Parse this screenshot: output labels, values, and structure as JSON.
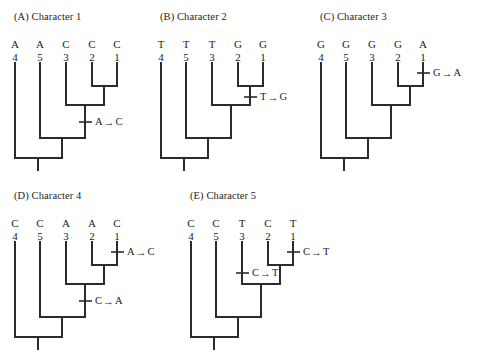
{
  "figure": {
    "background": "#ffffff",
    "line_color": "#2b2b2b",
    "panels": [
      {
        "id": "A",
        "title": "(A)  Character 1",
        "tips": [
          {
            "state": "A",
            "num": "4"
          },
          {
            "state": "A",
            "num": "5"
          },
          {
            "state": "C",
            "num": "3"
          },
          {
            "state": "C",
            "num": "2"
          },
          {
            "state": "C",
            "num": "1"
          }
        ],
        "changes": [
          {
            "from": "A",
            "arrow": "→",
            "to": "C",
            "branch": "internal-node-3-clade"
          }
        ]
      },
      {
        "id": "B",
        "title": "(B)  Character 2",
        "tips": [
          {
            "state": "T",
            "num": "4"
          },
          {
            "state": "T",
            "num": "5"
          },
          {
            "state": "T",
            "num": "3"
          },
          {
            "state": "G",
            "num": "2"
          },
          {
            "state": "G",
            "num": "1"
          }
        ],
        "changes": [
          {
            "from": "T",
            "arrow": "→",
            "to": "G",
            "branch": "internal-node-1-2-clade"
          }
        ]
      },
      {
        "id": "C",
        "title": "(C)  Character 3",
        "tips": [
          {
            "state": "G",
            "num": "4"
          },
          {
            "state": "G",
            "num": "5"
          },
          {
            "state": "G",
            "num": "3"
          },
          {
            "state": "G",
            "num": "2"
          },
          {
            "state": "A",
            "num": "1"
          }
        ],
        "changes": [
          {
            "from": "G",
            "arrow": "→",
            "to": "A",
            "branch": "terminal-branch-taxon-1"
          }
        ]
      },
      {
        "id": "D",
        "title": "(D)  Character 4",
        "tips": [
          {
            "state": "C",
            "num": "4"
          },
          {
            "state": "C",
            "num": "5"
          },
          {
            "state": "A",
            "num": "3"
          },
          {
            "state": "A",
            "num": "2"
          },
          {
            "state": "C",
            "num": "1"
          }
        ],
        "changes": [
          {
            "from": "A",
            "arrow": "→",
            "to": "C",
            "branch": "terminal-branch-taxon-1"
          },
          {
            "from": "C",
            "arrow": "→",
            "to": "A",
            "branch": "internal-node-3-clade"
          }
        ]
      },
      {
        "id": "E",
        "title": "(E)  Character 5",
        "tips": [
          {
            "state": "C",
            "num": "4"
          },
          {
            "state": "C",
            "num": "5"
          },
          {
            "state": "T",
            "num": "3"
          },
          {
            "state": "C",
            "num": "2"
          },
          {
            "state": "T",
            "num": "1"
          }
        ],
        "changes": [
          {
            "from": "C",
            "arrow": "→",
            "to": "T",
            "branch": "terminal-branch-taxon-1"
          },
          {
            "from": "C",
            "arrow": "→",
            "to": "T",
            "branch": "terminal-branch-taxon-3"
          }
        ]
      }
    ]
  }
}
